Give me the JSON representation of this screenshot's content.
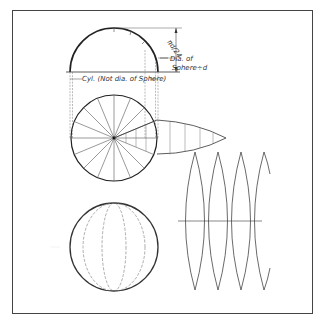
{
  "figure": {
    "colors": {
      "background": "#ffffff",
      "line": "#2a2a2a",
      "thin_line": "#555555",
      "frame": "#444444"
    },
    "labels": {
      "dia_line1": "Dia. of",
      "dia_line2": "Sphere÷d",
      "cyl_label": "Cyl. (Not dia. of Sphere)",
      "small_dim": "πd/24"
    },
    "views": {
      "front_semicircle": {
        "cx": 114,
        "cy": 72,
        "r": 44
      },
      "top_circle": {
        "cx": 114,
        "cy": 138,
        "r": 43,
        "segments": 16
      },
      "sphere": {
        "cx": 114,
        "cy": 247,
        "r": 44,
        "meridians": 5
      },
      "gore_pattern": {
        "count": 4,
        "tip_xs": [
          195,
          218,
          241,
          264
        ],
        "top_y": 152,
        "bottom_y": 290,
        "center_y": 221
      }
    }
  }
}
